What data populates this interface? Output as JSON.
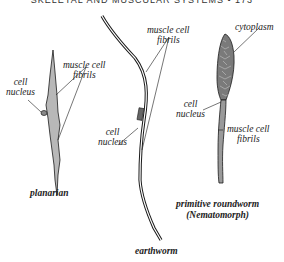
{
  "header": {
    "running_title": "SKELETAL AND MUSCULAR SYSTEMS",
    "separator": "•",
    "page_number": "173"
  },
  "figures": {
    "planarian": {
      "caption": "planarian",
      "labels": {
        "nucleus_line1": "cell",
        "nucleus_line2": "nucleus",
        "fibrils_line1": "muscle cell",
        "fibrils_line2": "fibrils"
      }
    },
    "earthworm": {
      "caption": "earthworm",
      "labels": {
        "fibrils_line1": "muscle cell",
        "fibrils_line2": "fibrils",
        "nucleus_line1": "cell",
        "nucleus_line2": "nucleus"
      }
    },
    "roundworm": {
      "caption_line1": "primitive roundworm",
      "caption_line2": "(Nematomorph)",
      "labels": {
        "cytoplasm": "cytoplasm",
        "nucleus_line1": "cell",
        "nucleus_line2": "nucleus",
        "fibrils_line1": "muscle cell",
        "fibrils_line2": "fibrils"
      }
    }
  },
  "colors": {
    "ink": "#1a1a1a",
    "cell_fill": "#b8b8b8",
    "cytoplasm_fill": "#7a7a7a"
  }
}
